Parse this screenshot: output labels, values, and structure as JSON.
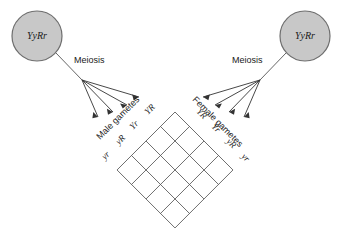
{
  "diagram": {
    "background_color": "#ffffff",
    "line_color": "#555555",
    "text_color": "#1a1a1a",
    "parents": [
      {
        "id": "male-parent",
        "genotype": "YyRr",
        "fill_color": "#c8c8c8",
        "stroke_color": "#6e6e6e",
        "meiosis_label": "Meiosis"
      },
      {
        "id": "female-parent",
        "genotype": "YyRr",
        "fill_color": "#c8c8c8",
        "stroke_color": "#6e6e6e",
        "meiosis_label": "Meiosis"
      }
    ],
    "gamete_groups": [
      {
        "id": "male-gametes",
        "title": "Male gametes",
        "alleles": [
          "YR",
          "Yr",
          "yR",
          "yr"
        ]
      },
      {
        "id": "female-gametes",
        "title": "Female gametes",
        "alleles": [
          "YR",
          "Yr",
          "yR",
          "yr"
        ]
      }
    ],
    "punnett_square": {
      "rows": 4,
      "columns": 4,
      "rotation_degrees": 45,
      "cells_filled": false,
      "cell_values": [
        [
          "",
          "",
          "",
          ""
        ],
        [
          "",
          "",
          "",
          ""
        ],
        [
          "",
          "",
          "",
          ""
        ],
        [
          "",
          "",
          "",
          ""
        ]
      ]
    }
  }
}
